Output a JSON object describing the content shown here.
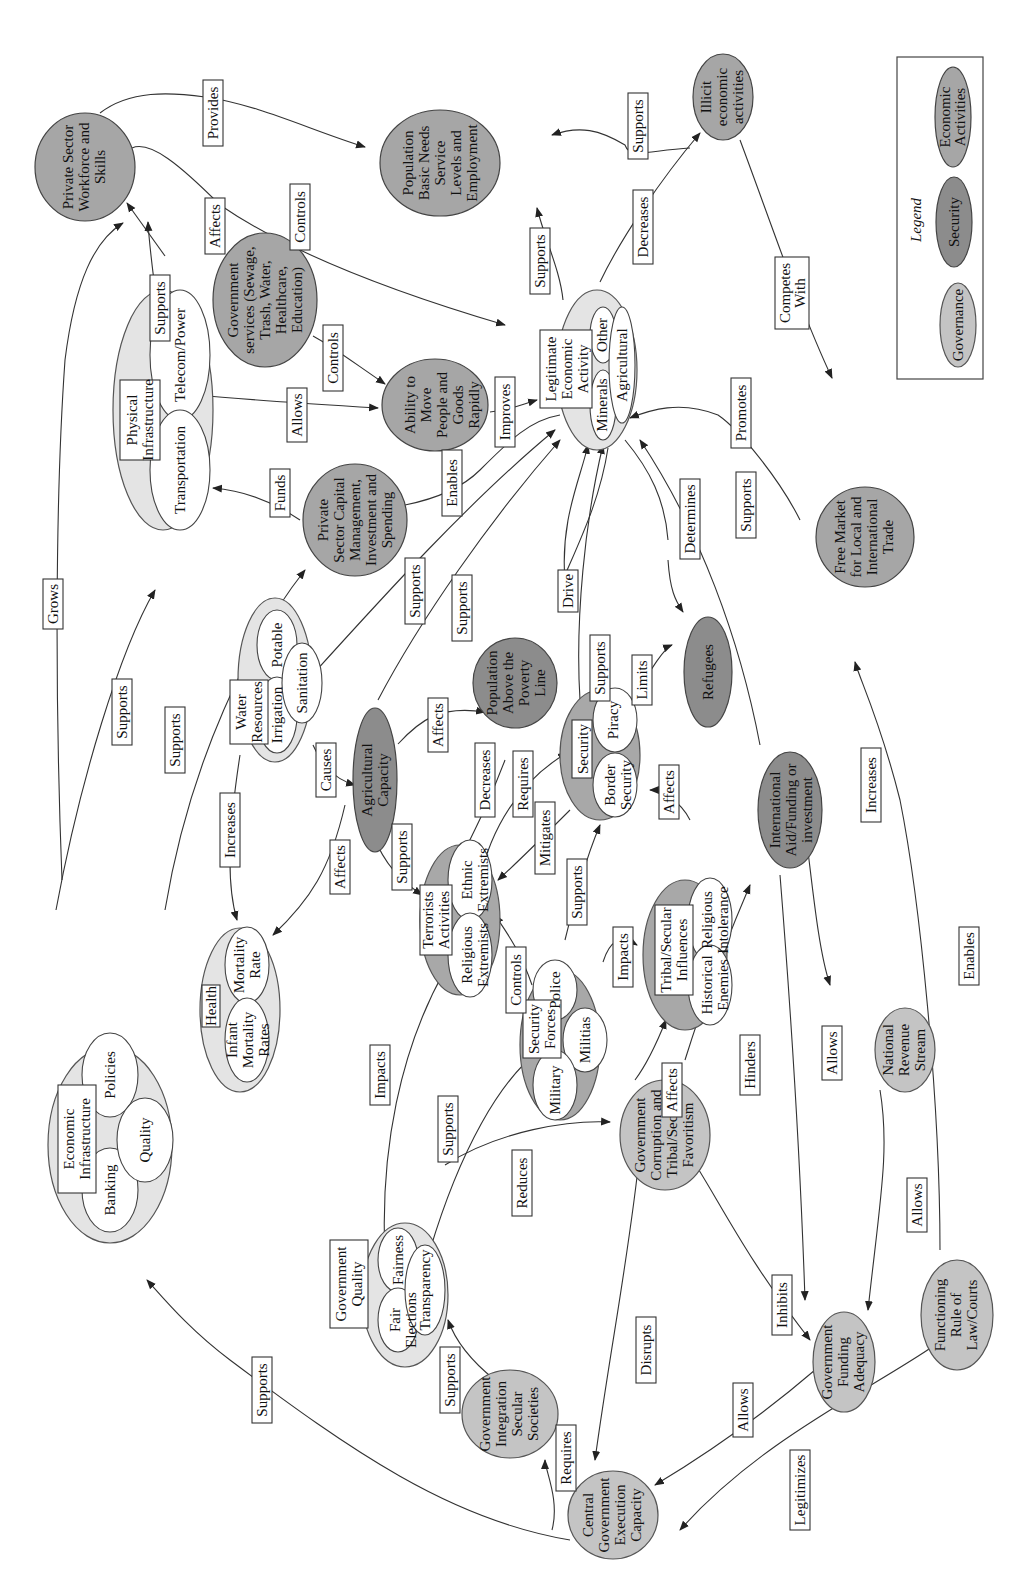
{
  "legend": {
    "title": "Legend",
    "items": [
      {
        "label": "Governance",
        "color": "#c4c4c4"
      },
      {
        "label": "Security",
        "color": "#8c8c8c"
      },
      {
        "label": "Economic Activities",
        "color": "#a6a6a6"
      }
    ]
  },
  "nodes": {
    "private_sector_workforce": "Private Sector Workforce and Skills",
    "population_basic_needs": "Population Basic Needs Service Levels and Employment",
    "illicit_economic": "Illicit economic activities",
    "government_services": "Government services (Sewage, Trash, Water, Healthcare, Education)",
    "ability_to_move": "Ability to Move People and Goods Rapidly",
    "private_sector_capital": "Private Sector Capital Management, Investment and Spending",
    "agricultural_capacity": "Agricultural Capacity",
    "population_above_poverty": "Population Above the Poverty Line",
    "refugees": "Refugees",
    "free_market": "Free Market for Local and International Trade",
    "international_aid": "International Aid/Funding or investment",
    "national_revenue": "National Revenue Stream",
    "government_corruption": "Government Corruption and Tribal/Secular Favoritism",
    "government_integration": "Government Integration Secular Societies",
    "central_government": "Central Government Execution Capacity",
    "government_funding": "Government Funding Adequacy",
    "rule_of_law": "Functioning Rule of Law/Courts"
  },
  "groups": {
    "physical_infrastructure": {
      "title": "Physical Infrastructure",
      "items": [
        "Transportation",
        "Telecom/Power"
      ]
    },
    "legitimate_economic": {
      "title": "Legitimate Economic Activity",
      "items": [
        "Minerals",
        "Other",
        "Agricultural"
      ]
    },
    "water_resources": {
      "title": "Water Resources",
      "items": [
        "Irrigation",
        "Potable",
        "Sanitation"
      ]
    },
    "health": {
      "title": "Health",
      "items": [
        "Infant Mortality Rates",
        "Mortality Rate"
      ]
    },
    "terrorists": {
      "title": "Terrorists Activities",
      "items": [
        "Religious Extremists",
        "Ethnic Extremists"
      ]
    },
    "security": {
      "title": "Security",
      "items": [
        "Border Security",
        "Piracy"
      ]
    },
    "security_forces": {
      "title": "Security Forces",
      "items": [
        "Military",
        "Police",
        "Militias"
      ]
    },
    "tribal_secular": {
      "title": "Tribal/Secular Influences",
      "items": [
        "Historical Enemies",
        "Religious Intolerance"
      ]
    },
    "economic_infrastructure": {
      "title": "Economic Infrastructure",
      "items": [
        "Banking",
        "Policies",
        "Quality"
      ]
    },
    "government_quality": {
      "title": "Government Quality",
      "items": [
        "Fair Elections",
        "Fairness",
        "Transparency"
      ]
    }
  },
  "edge_labels": {
    "provides": "Provides",
    "controls_ws": "Controls",
    "affects_gs": "Affects",
    "supports_pi_ws": "Supports",
    "grows": "Grows",
    "supports_ill": "Supports",
    "decreases_ill": "Decreases",
    "supports_le_pop": "Supports",
    "competes_with": "Competes With",
    "controls_move": "Controls",
    "allows_move": "Allows",
    "improves": "Improves",
    "funds": "Funds",
    "enables": "Enables",
    "supports_ei_pi": "Supports",
    "supports_ei_pc": "Supports",
    "supports_wr_le": "Supports",
    "supports_ac_le": "Supports",
    "increases_health": "Increases",
    "causes": "Causes",
    "affects_pov": "Affects",
    "drive": "Drive",
    "determines": "Determines",
    "promotes": "Promotes",
    "supports_sec_le": "Supports",
    "supports_aid_le": "Supports",
    "limits": "Limits",
    "affects_health": "Affects",
    "supports_terr": "Supports",
    "decreases_terr": "Decreases",
    "requires_sec": "Requires",
    "mitigates": "Mitigates",
    "supports_sf_sec": "Supports",
    "controls_terr": "Controls",
    "impacts_tribal": "Impacts",
    "affects_sec": "Affects",
    "impacts_terr": "Impacts",
    "supports_gq_sf": "Supports",
    "reduces": "Reduces",
    "affects_tribal": "Affects",
    "hinders": "Hinders",
    "increases_rev": "Increases",
    "allows_aid": "Allows",
    "enables_fm": "Enables",
    "allows_rev": "Allows",
    "supports_gi": "Supports",
    "disrupts": "Disrupts",
    "inhibits": "Inhibits",
    "requires_gi": "Requires",
    "allows_cg": "Allows",
    "legitimizes": "Legitimizes",
    "supports_cg_ei": "Supports"
  }
}
